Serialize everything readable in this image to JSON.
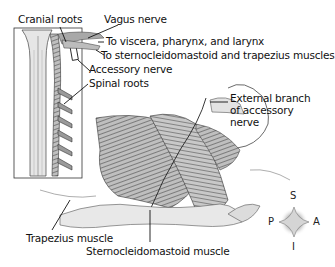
{
  "figure": {
    "labels": {
      "cranial_roots": "Cranial roots",
      "vagus_nerve": "Vagus nerve",
      "to_viscera": "To viscera, pharynx, and larynx",
      "to_scm_trapezius": "To sternocleidomastoid and trapezius muscles",
      "accessory_nerve": "Accessory nerve",
      "spinal_roots": "Spinal roots",
      "external_branch_line1": "External branch",
      "external_branch_line2": "of accessory",
      "external_branch_line3": "nerve",
      "trapezius_muscle": "Trapezius muscle",
      "sternocleidomastoid_muscle": "Sternocleidomastoid muscle"
    },
    "compass": {
      "superior": "S",
      "inferior": "I",
      "posterior": "P",
      "anterior": "A"
    },
    "colors": {
      "line": "#1a1a1a",
      "muscle_dark": "#6e6e6e",
      "muscle_light": "#bdbdbd",
      "cord": "#d9d9d9",
      "bone": "#e8e8e8"
    }
  }
}
